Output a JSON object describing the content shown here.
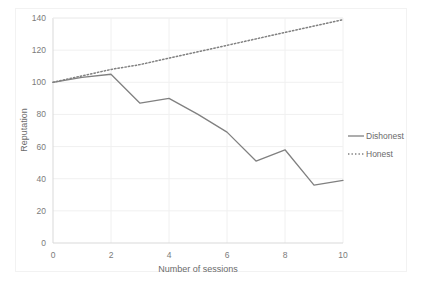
{
  "chart_data": {
    "type": "line",
    "title": "",
    "xlabel": "Number of sessions",
    "ylabel": "Reputation",
    "xlim": [
      0,
      10
    ],
    "ylim": [
      0,
      140
    ],
    "x": [
      0,
      1,
      2,
      3,
      4,
      5,
      6,
      7,
      8,
      9,
      10
    ],
    "xticks": [
      "0",
      "2",
      "4",
      "6",
      "8",
      "10"
    ],
    "xtick_values": [
      0,
      2,
      4,
      6,
      8,
      10
    ],
    "yticks": [
      "0",
      "20",
      "40",
      "60",
      "80",
      "100",
      "120",
      "140"
    ],
    "ytick_values": [
      0,
      20,
      40,
      60,
      80,
      100,
      120,
      140
    ],
    "grid": "horizontal-and-vertical",
    "legend_position": "right",
    "series": [
      {
        "name": "Dishonest",
        "style": "solid",
        "color": "#808080",
        "values": [
          100,
          103,
          105,
          87,
          90,
          80,
          69,
          51,
          58,
          36,
          39
        ]
      },
      {
        "name": "Honest",
        "style": "dotted",
        "color": "#808080",
        "values": [
          100,
          104,
          108,
          111,
          115,
          119,
          123,
          127,
          131,
          135,
          139
        ]
      }
    ]
  },
  "legend": {
    "items": [
      {
        "label": "Dishonest",
        "style": "solid"
      },
      {
        "label": "Honest",
        "style": "dotted"
      }
    ]
  },
  "axes": {
    "x_title": "Number of sessions",
    "y_title": "Reputation"
  }
}
